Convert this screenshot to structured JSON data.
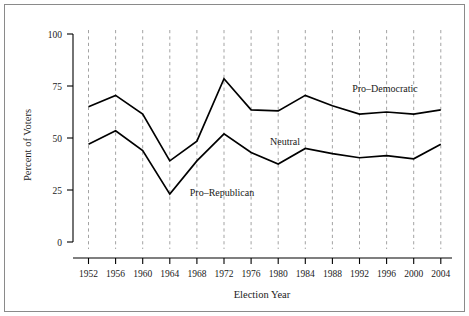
{
  "chart_data": {
    "type": "line",
    "title": "",
    "xlabel": "Election Year",
    "ylabel": "Percent of Voters",
    "x": [
      1952,
      1956,
      1960,
      1964,
      1968,
      1972,
      1976,
      1980,
      1984,
      1988,
      1992,
      1996,
      2000,
      2004
    ],
    "categories": [
      "1952",
      "1956",
      "1960",
      "1964",
      "1968",
      "1972",
      "1976",
      "1980",
      "1984",
      "1988",
      "1992",
      "1996",
      "2000",
      "2004"
    ],
    "series": [
      {
        "name": "Pro-Democratic",
        "values": [
          65,
          70.5,
          61.5,
          39,
          48.5,
          78.5,
          63.5,
          63,
          70.5,
          65.5,
          61.5,
          62.5,
          61.5,
          63.5
        ]
      },
      {
        "name": "Pro-Republican",
        "values": [
          47,
          53.5,
          44,
          23,
          39,
          52,
          43,
          37.5,
          45,
          42.5,
          40.5,
          41.5,
          40,
          47
        ]
      }
    ],
    "ylim": [
      0,
      100
    ],
    "yticks": [
      0,
      25,
      50,
      75,
      100
    ],
    "ytick_labels": [
      "0",
      "25",
      "50",
      "75",
      "100"
    ],
    "grid": "vertical-dashed",
    "legend": "inline-annotations",
    "annotations": [
      {
        "text": "Pro–Democratic",
        "x": 1990,
        "y": 81
      },
      {
        "text": "Neutral",
        "x": 1978.2,
        "y": 55.5
      },
      {
        "text": "Pro–Republican",
        "x": 1970.5,
        "y": 31
      }
    ],
    "colors": {
      "line": "#000000",
      "gridline": "#999999",
      "axis": "#000000",
      "background": "#ffffff",
      "frame_border": "#8a8a8a"
    }
  }
}
